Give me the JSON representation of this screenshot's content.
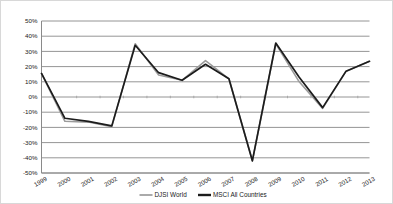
{
  "chart_data": {
    "type": "line",
    "title": "",
    "xlabel": "",
    "ylabel": "",
    "categories": [
      "1999",
      "2000",
      "2001",
      "2002",
      "2003",
      "2004",
      "2005",
      "2006",
      "2007",
      "2008",
      "2009",
      "2010",
      "2011",
      "2012",
      "2013"
    ],
    "ylim": [
      -50,
      50
    ],
    "ytick_labels": [
      "50%",
      "40%",
      "30%",
      "20%",
      "10%",
      "0%",
      "-10%",
      "-20%",
      "-30%",
      "-40%",
      "-50%"
    ],
    "ytick_values": [
      50,
      40,
      30,
      20,
      10,
      0,
      -10,
      -20,
      -30,
      -40,
      -50
    ],
    "grid": true,
    "legend_position": "bottom",
    "series": [
      {
        "name": "DJSI World",
        "color": "#9b9b9b",
        "values": [
          15.5,
          -16.0,
          -16.5,
          -19.5,
          35.0,
          14.5,
          11.0,
          24.0,
          12.0,
          -42.0,
          35.0,
          10.0,
          -7.5,
          17.0,
          23.5
        ]
      },
      {
        "name": "MSCI All Countries",
        "color": "#1c1c1c",
        "values": [
          15.5,
          -14.0,
          -16.0,
          -19.0,
          34.0,
          16.0,
          11.0,
          21.5,
          12.0,
          -42.0,
          35.5,
          13.0,
          -7.0,
          17.0,
          23.5
        ]
      }
    ]
  },
  "legend": {
    "items": [
      {
        "label": "DJSI World",
        "color": "#9b9b9b"
      },
      {
        "label": "MSCI All Countries",
        "color": "#1c1c1c"
      }
    ]
  }
}
